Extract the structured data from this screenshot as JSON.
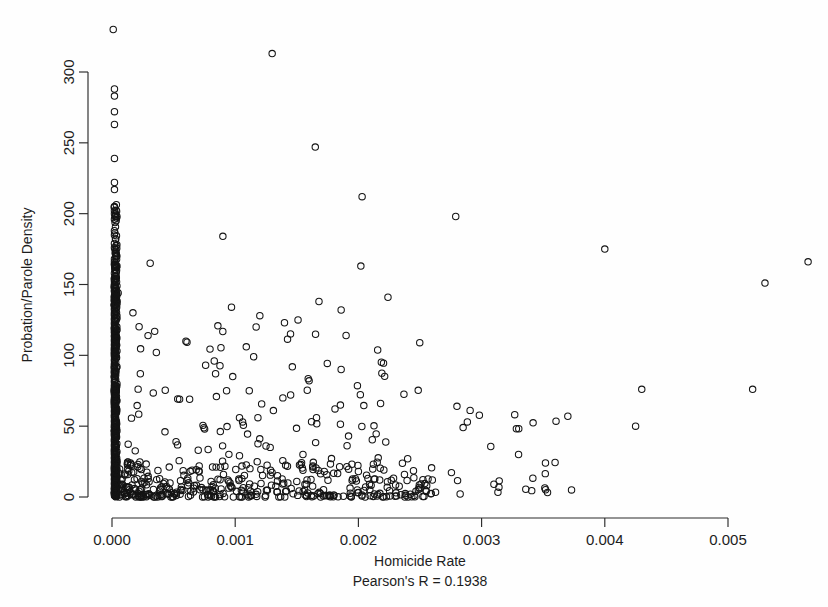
{
  "chart_data": {
    "type": "scatter",
    "title": "",
    "xlabel": "Homicide Rate",
    "ylabel": "Probation/Parole Density",
    "annotation": "Pearson's R = 0.1938",
    "pearson_r": 0.1938,
    "grid": false,
    "legend": null,
    "box": false,
    "marker": "open-circle",
    "marker_color": "#141414",
    "xlim": [
      -0.00012,
      0.00578
    ],
    "ylim": [
      -9,
      345
    ],
    "xticks": [
      0.0,
      0.001,
      0.002,
      0.003,
      0.004,
      0.005
    ],
    "xtick_labels": [
      "0.000",
      "0.001",
      "0.002",
      "0.003",
      "0.004",
      "0.005"
    ],
    "yticks": [
      0,
      50,
      100,
      150,
      200,
      250,
      300
    ],
    "ytick_labels": [
      "0",
      "50",
      "100",
      "150",
      "200",
      "250",
      "300"
    ],
    "n_points": 968,
    "points": [
      [
        1e-05,
        330
      ],
      [
        0.0013,
        313
      ],
      [
        2e-05,
        288
      ],
      [
        2e-05,
        283
      ],
      [
        2e-05,
        272
      ],
      [
        2e-05,
        263
      ],
      [
        0.00165,
        247
      ],
      [
        2e-05,
        239
      ],
      [
        2e-05,
        222
      ],
      [
        2e-05,
        217
      ],
      [
        0.00203,
        212
      ],
      [
        0.00279,
        198
      ],
      [
        2e-05,
        205
      ],
      [
        2e-05,
        202
      ],
      [
        2e-05,
        200
      ],
      [
        3e-05,
        199
      ],
      [
        4e-05,
        198
      ],
      [
        2e-05,
        196
      ],
      [
        0.0009,
        184
      ],
      [
        2e-05,
        188
      ],
      [
        2e-05,
        185
      ],
      [
        3e-05,
        182
      ],
      [
        2e-05,
        179
      ],
      [
        2e-05,
        176
      ],
      [
        0.004,
        175
      ],
      [
        0.00565,
        166
      ],
      [
        0.00031,
        165
      ],
      [
        2e-05,
        168
      ],
      [
        2e-05,
        166
      ],
      [
        2e-05,
        164
      ],
      [
        4e-05,
        163
      ],
      [
        0.00202,
        163
      ],
      [
        0.0053,
        151
      ],
      [
        2e-05,
        158
      ],
      [
        3e-05,
        156
      ],
      [
        2e-05,
        154
      ],
      [
        2e-05,
        152
      ],
      [
        3e-05,
        151
      ],
      [
        2e-05,
        150
      ],
      [
        4e-05,
        149
      ],
      [
        2e-05,
        148
      ],
      [
        3e-05,
        147
      ],
      [
        2e-05,
        146
      ],
      [
        2e-05,
        145
      ],
      [
        5e-05,
        144
      ],
      [
        3e-05,
        143
      ],
      [
        2e-05,
        142
      ],
      [
        0.00224,
        141
      ],
      [
        2e-05,
        141
      ],
      [
        3e-05,
        140
      ],
      [
        2e-05,
        139
      ],
      [
        0.00168,
        138
      ],
      [
        2e-05,
        138
      ],
      [
        4e-05,
        137
      ],
      [
        2e-05,
        136
      ],
      [
        2e-05,
        135
      ],
      [
        3e-05,
        134
      ],
      [
        0.00097,
        134
      ],
      [
        2e-05,
        133
      ],
      [
        2e-05,
        132
      ],
      [
        0.00186,
        132
      ],
      [
        3e-05,
        131
      ],
      [
        2e-05,
        130
      ],
      [
        0.00017,
        130
      ],
      [
        2e-05,
        129
      ],
      [
        2e-05,
        128
      ],
      [
        0.0012,
        128
      ],
      [
        3e-05,
        127
      ],
      [
        2e-05,
        126
      ],
      [
        2e-05,
        125
      ],
      [
        0.00151,
        125
      ],
      [
        3e-05,
        124
      ],
      [
        2e-05,
        123
      ],
      [
        0.0014,
        123
      ],
      [
        2e-05,
        122
      ],
      [
        3e-05,
        121
      ],
      [
        2e-05,
        120
      ],
      [
        0.00117,
        120
      ],
      [
        2e-05,
        119
      ],
      [
        4e-05,
        118
      ],
      [
        2e-05,
        117
      ],
      [
        2e-05,
        116
      ],
      [
        3e-05,
        115
      ],
      [
        2e-05,
        114
      ],
      [
        0.0019,
        114
      ],
      [
        2e-05,
        113
      ],
      [
        3e-05,
        112
      ],
      [
        2e-05,
        111
      ],
      [
        2e-05,
        110
      ],
      [
        0.0006,
        110
      ],
      [
        3e-05,
        109
      ],
      [
        2e-05,
        108
      ],
      [
        2e-05,
        107
      ],
      [
        3e-05,
        106
      ],
      [
        0.00109,
        106
      ],
      [
        2e-05,
        105
      ],
      [
        2e-05,
        104
      ],
      [
        4e-05,
        103
      ],
      [
        2e-05,
        102
      ],
      [
        0.00036,
        102
      ],
      [
        3e-05,
        101
      ],
      [
        2e-05,
        100
      ],
      [
        2e-05,
        99
      ],
      [
        0.00115,
        99
      ],
      [
        3e-05,
        98
      ],
      [
        2e-05,
        97
      ],
      [
        2e-05,
        96
      ],
      [
        0.00083,
        96
      ],
      [
        3e-05,
        95
      ],
      [
        2e-05,
        94
      ],
      [
        2e-05,
        93
      ],
      [
        0.00076,
        93
      ],
      [
        4e-05,
        92
      ],
      [
        2e-05,
        91
      ],
      [
        2e-05,
        90
      ],
      [
        0.00186,
        90
      ],
      [
        3e-05,
        89
      ],
      [
        2e-05,
        88
      ],
      [
        2e-05,
        87
      ],
      [
        0.00023,
        87
      ],
      [
        3e-05,
        86
      ],
      [
        2e-05,
        85
      ],
      [
        0.00098,
        85
      ],
      [
        2e-05,
        84
      ],
      [
        3e-05,
        83
      ],
      [
        2e-05,
        82
      ],
      [
        0.0016,
        82
      ],
      [
        2e-05,
        81
      ],
      [
        4e-05,
        80
      ],
      [
        2e-05,
        79
      ],
      [
        0.0043,
        76
      ],
      [
        2e-05,
        78
      ],
      [
        0.0052,
        76
      ],
      [
        3e-05,
        77
      ],
      [
        2e-05,
        76
      ],
      [
        2e-05,
        75
      ],
      [
        0.00093,
        75
      ],
      [
        3e-05,
        74
      ],
      [
        2e-05,
        73
      ],
      [
        2e-05,
        72
      ],
      [
        0.00145,
        72
      ],
      [
        3e-05,
        71
      ],
      [
        2e-05,
        70
      ],
      [
        2e-05,
        69
      ],
      [
        0.00063,
        69
      ],
      [
        4e-05,
        68
      ],
      [
        2e-05,
        67
      ],
      [
        2e-05,
        66
      ],
      [
        0.00218,
        66
      ],
      [
        3e-05,
        65
      ],
      [
        2e-05,
        64
      ],
      [
        0.0028,
        64
      ],
      [
        2e-05,
        63
      ],
      [
        3e-05,
        62
      ],
      [
        2e-05,
        61
      ],
      [
        0.00131,
        61
      ],
      [
        2e-05,
        60
      ],
      [
        3e-05,
        59
      ],
      [
        2e-05,
        58
      ],
      [
        0.0037,
        57
      ],
      [
        2e-05,
        57
      ],
      [
        2e-05,
        56
      ],
      [
        0.00166,
        56
      ],
      [
        3e-05,
        55
      ],
      [
        2e-05,
        54
      ],
      [
        2e-05,
        53
      ],
      [
        0.00106,
        53
      ],
      [
        3e-05,
        52
      ],
      [
        2e-05,
        51
      ],
      [
        0.00425,
        50
      ],
      [
        2e-05,
        50
      ],
      [
        2e-05,
        49
      ],
      [
        0.00285,
        49
      ],
      [
        3e-05,
        48
      ],
      [
        2e-05,
        47
      ],
      [
        2e-05,
        46
      ],
      [
        0.00043,
        46
      ],
      [
        3e-05,
        45
      ],
      [
        2e-05,
        44
      ],
      [
        2e-05,
        43
      ],
      [
        0.00192,
        43
      ],
      [
        3e-05,
        42
      ],
      [
        2e-05,
        41
      ],
      [
        0.0033,
        30
      ],
      [
        2e-05,
        40
      ],
      [
        2e-05,
        39
      ],
      [
        0.00052,
        39
      ],
      [
        3e-05,
        38
      ],
      [
        2e-05,
        37
      ],
      [
        2e-05,
        36
      ],
      [
        0.00125,
        36
      ],
      [
        3e-05,
        35
      ],
      [
        2e-05,
        34
      ],
      [
        2e-05,
        33
      ],
      [
        0.0007,
        33
      ],
      [
        4e-05,
        32
      ],
      [
        2e-05,
        31
      ],
      [
        2e-05,
        30
      ],
      [
        0.00155,
        30
      ],
      [
        3e-05,
        29
      ],
      [
        2e-05,
        28
      ],
      [
        2e-05,
        27
      ],
      [
        0.0024,
        27
      ],
      [
        3e-05,
        26
      ],
      [
        2e-05,
        25
      ],
      [
        2e-05,
        24
      ],
      [
        0.00015,
        24
      ],
      [
        3e-05,
        23
      ],
      [
        2e-05,
        22
      ],
      [
        2e-05,
        21
      ],
      [
        0.00088,
        21
      ],
      [
        3e-05,
        20
      ],
      [
        2e-05,
        19
      ],
      [
        2e-05,
        18
      ],
      [
        0.002,
        18
      ],
      [
        3e-05,
        17
      ],
      [
        2e-05,
        16
      ],
      [
        2e-05,
        15
      ],
      [
        0.00373,
        5
      ],
      [
        3e-05,
        14
      ],
      [
        2e-05,
        13
      ],
      [
        2e-05,
        12
      ],
      [
        0.0026,
        12
      ],
      [
        3e-05,
        11
      ],
      [
        2e-05,
        10
      ],
      [
        2e-05,
        9
      ],
      [
        0.0031,
        9
      ],
      [
        3e-05,
        8
      ],
      [
        2e-05,
        7
      ],
      [
        2e-05,
        6
      ],
      [
        5e-05,
        5
      ],
      [
        3e-05,
        4
      ],
      [
        2e-05,
        3
      ],
      [
        2e-05,
        2
      ],
      [
        3e-05,
        1
      ],
      [
        2e-05,
        1
      ]
    ]
  },
  "axes": {
    "x": {
      "title": "Homicide Rate",
      "subtitle": "Pearson's R = 0.1938",
      "tick_labels": [
        "0.000",
        "0.001",
        "0.002",
        "0.003",
        "0.004",
        "0.005"
      ]
    },
    "y": {
      "title": "Probation/Parole Density",
      "tick_labels": [
        "0",
        "50",
        "100",
        "150",
        "200",
        "250",
        "300"
      ]
    }
  }
}
